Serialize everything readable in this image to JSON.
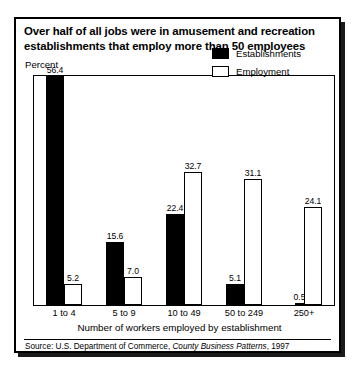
{
  "figure": {
    "title": "Over half of all jobs were in amusement and recreation establishments that employ more than 50 employees",
    "percent_label": "Percent",
    "source_prefix": "Source: U.S. Department of Commerce, ",
    "source_italic": "County Business Patterns",
    "source_suffix": ", 1997"
  },
  "legend": {
    "items": [
      {
        "label": "Establishments",
        "swatch": "solid-black-square",
        "color": "#000000"
      },
      {
        "label": "Employment",
        "swatch": "hollow-white-square",
        "color": "#FFFFFF"
      }
    ]
  },
  "chart_data": {
    "type": "bar",
    "title": "Over half of all jobs were in amusement and recreation establishments that employ more than 50 employees",
    "xlabel": "Number of workers employed by establishment",
    "ylabel": "Percent",
    "ylim": [
      0,
      56.4
    ],
    "grid": false,
    "legend_position": "top-right",
    "categories": [
      "1 to 4",
      "5 to 9",
      "10 to 49",
      "50 to 249",
      "250+"
    ],
    "series": [
      {
        "name": "Establishments",
        "color": "#000000",
        "values": [
          56.4,
          15.6,
          22.4,
          5.1,
          0.5
        ],
        "labels": [
          "56.4",
          "15.6",
          "22.4",
          "5.1",
          "0.5"
        ]
      },
      {
        "name": "Employment",
        "color": "#FFFFFF",
        "values": [
          5.2,
          7.0,
          32.7,
          31.1,
          24.1
        ],
        "labels": [
          "5.2",
          "7.0",
          "32.7",
          "31.1",
          "24.1"
        ]
      }
    ],
    "source": "Source: U.S. Department of Commerce, County Business Patterns, 1997"
  }
}
